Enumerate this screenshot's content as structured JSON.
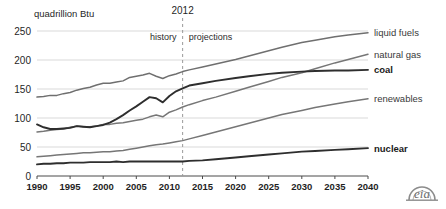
{
  "chart_data": {
    "type": "line",
    "title": "",
    "xlabel": "",
    "ylabel": "quadrillion Btu",
    "xlim": [
      1990,
      2040
    ],
    "ylim": [
      0,
      250
    ],
    "grid": true,
    "legend_position": "right-inline",
    "x_ticks": [
      1990,
      1995,
      2000,
      2005,
      2010,
      2015,
      2020,
      2025,
      2030,
      2035,
      2040
    ],
    "y_ticks": [
      0,
      50,
      100,
      150,
      200,
      250
    ],
    "annotations": {
      "divider_year": 2012,
      "divider_label": "2012",
      "left_label": "history",
      "right_label": "projections"
    },
    "x": [
      1990,
      1991,
      1992,
      1993,
      1994,
      1995,
      1996,
      1997,
      1998,
      1999,
      2000,
      2001,
      2002,
      2003,
      2004,
      2005,
      2006,
      2007,
      2008,
      2009,
      2010,
      2011,
      2012,
      2013,
      2015,
      2017,
      2020,
      2022,
      2025,
      2027,
      2030,
      2032,
      2035,
      2037,
      2040
    ],
    "series": [
      {
        "name": "liquid fuels",
        "color": "#6f6f6f",
        "values": [
          136,
          137,
          139,
          139,
          142,
          144,
          148,
          151,
          153,
          157,
          160,
          160,
          162,
          164,
          170,
          172,
          174,
          177,
          172,
          168,
          173,
          176,
          180,
          183,
          188,
          193,
          201,
          207,
          216,
          222,
          230,
          234,
          240,
          243,
          247
        ]
      },
      {
        "name": "natural gas",
        "color": "#767676",
        "values": [
          76,
          77,
          79,
          80,
          81,
          84,
          86,
          85,
          85,
          86,
          89,
          89,
          91,
          92,
          94,
          96,
          98,
          102,
          105,
          102,
          110,
          114,
          119,
          123,
          130,
          136,
          146,
          153,
          163,
          170,
          178,
          185,
          195,
          201,
          210
        ]
      },
      {
        "name": "coal",
        "color": "#2e2e2e",
        "values": [
          89,
          84,
          81,
          81,
          82,
          83,
          86,
          85,
          84,
          86,
          88,
          92,
          98,
          105,
          113,
          120,
          128,
          136,
          134,
          127,
          138,
          146,
          151,
          156,
          160,
          164,
          169,
          172,
          176,
          178,
          180,
          181,
          182,
          182,
          183
        ]
      },
      {
        "name": "renewables",
        "color": "#767676",
        "values": [
          33,
          34,
          35,
          36,
          37,
          38,
          39,
          40,
          40,
          41,
          42,
          42,
          43,
          44,
          46,
          48,
          50,
          52,
          54,
          55,
          57,
          59,
          61,
          64,
          70,
          76,
          85,
          91,
          100,
          106,
          113,
          118,
          124,
          128,
          133
        ]
      },
      {
        "name": "nuclear",
        "color": "#2e2e2e",
        "values": [
          20,
          21,
          21,
          22,
          22,
          23,
          23,
          23,
          24,
          24,
          24,
          24,
          25,
          24,
          25,
          25,
          25,
          25,
          25,
          25,
          25,
          25,
          25,
          26,
          27,
          29,
          32,
          34,
          37,
          39,
          42,
          43,
          45,
          46,
          48
        ]
      }
    ]
  },
  "branding": {
    "logo_text": "eia"
  }
}
